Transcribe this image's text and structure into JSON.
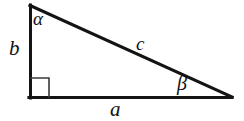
{
  "figure": {
    "kind": "right-triangle-diagram",
    "background_color": "#ffffff",
    "stroke_color": "#141414",
    "label_color": "#111111"
  },
  "labels": {
    "angle_alpha": "α",
    "angle_beta": "β",
    "side_a": "a",
    "side_b": "b",
    "side_c": "c"
  },
  "geometry": {
    "vertices": {
      "top_left": [
        30,
        5
      ],
      "bottom_left": [
        30,
        98
      ],
      "bottom_right": [
        232,
        98
      ]
    },
    "right_angle_marker_size": 19,
    "stroke_width": 3
  },
  "label_positions": {
    "angle_alpha": [
      38,
      18
    ],
    "angle_beta": [
      185,
      85
    ],
    "side_a": [
      118,
      110
    ],
    "side_b": [
      15,
      50
    ],
    "side_c": [
      143,
      45
    ]
  }
}
